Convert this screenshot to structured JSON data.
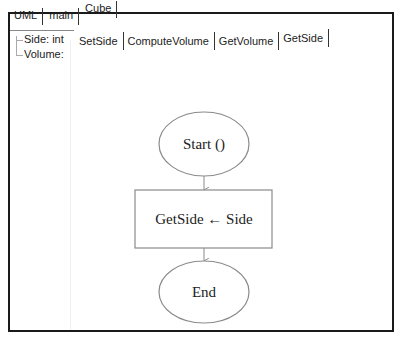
{
  "top_tabs": [
    {
      "label": "UML",
      "active": false
    },
    {
      "label": "main",
      "active": false
    },
    {
      "label": "Cube",
      "active": true
    }
  ],
  "tree": {
    "items": [
      {
        "label": "Side: int"
      },
      {
        "label": "Volume:"
      }
    ]
  },
  "method_tabs": [
    {
      "label": "SetSide",
      "active": false
    },
    {
      "label": "ComputeVolume",
      "active": false
    },
    {
      "label": "GetVolume",
      "active": false
    },
    {
      "label": "GetSide",
      "active": true
    }
  ],
  "flowchart": {
    "start": {
      "label": "Start ()"
    },
    "process": {
      "label": "GetSide ← Side"
    },
    "end": {
      "label": "End"
    }
  },
  "colors": {
    "frame_border": "#1a1a1a",
    "shape_stroke": "#8a8a8a",
    "text": "#222222"
  }
}
